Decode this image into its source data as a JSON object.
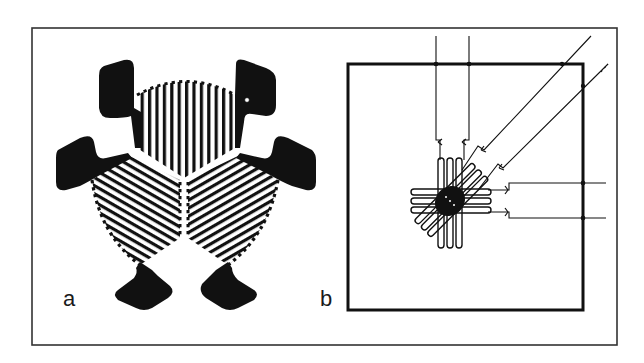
{
  "figure": {
    "panels": [
      {
        "id": "a",
        "label": "a",
        "description": "Three-element rosette strain gauge with serpentine grids and solder pads"
      },
      {
        "id": "b",
        "label": "b",
        "description": "Stacked three-element rosette with leads inside square carrier"
      }
    ]
  },
  "colors": {
    "ink": "#111111",
    "background": "#ffffff",
    "frame": "#333333"
  }
}
